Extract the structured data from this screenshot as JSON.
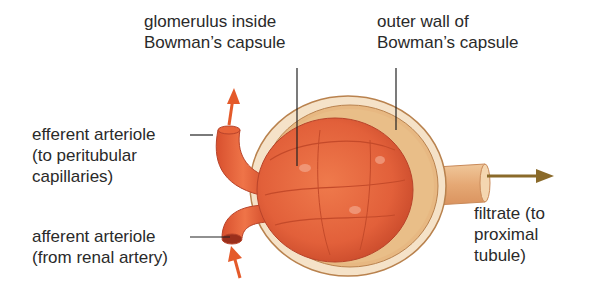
{
  "labels": {
    "glomerulus": "glomerulus inside\nBowman’s capsule",
    "outer_wall": "outer wall of\nBowman’s capsule",
    "efferent": "efferent arteriole\n(to peritubular\ncapillaries)",
    "afferent": "afferent arteriole\n(from renal artery)",
    "filtrate": "filtrate (to\nproximal\ntubule)"
  },
  "colors": {
    "vessel": "#e8643a",
    "vessel_dark": "#c9472a",
    "capsule_wall": "#f3dcc0",
    "capsule_inner": "#e6b57a",
    "tubule": "#e9b98a",
    "arrow_red": "#e45a2a",
    "arrow_brown": "#8a6a2a",
    "leader": "#222222"
  }
}
